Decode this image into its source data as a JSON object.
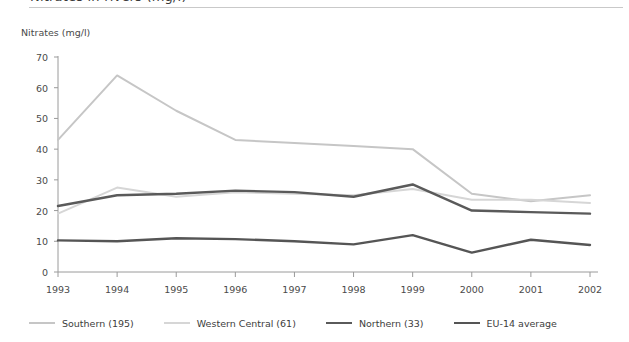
{
  "title": "Nitrates in rivers (mg/l)",
  "axis_title": "Nitrates (mg/l)",
  "legend": [
    {
      "label": "Southern (195)",
      "color": "#c6c6c6",
      "width": 2.0
    },
    {
      "label": "Western Central (61)",
      "color": "#d6d6d6",
      "width": 2.0
    },
    {
      "label": "Northern (33)",
      "color": "#5a5a5a",
      "width": 2.4
    },
    {
      "label": "EU-14 average",
      "color": "#555555",
      "width": 2.4
    }
  ],
  "chart_data": {
    "type": "line",
    "title": "Nitrates in rivers (mg/l)",
    "xlabel": "",
    "ylabel": "Nitrates (mg/l)",
    "categories": [
      "1993",
      "1994",
      "1995",
      "1996",
      "1997",
      "1998",
      "1999",
      "2000",
      "2001",
      "2002"
    ],
    "ylim": [
      0,
      70
    ],
    "yticks": [
      0,
      10,
      20,
      30,
      40,
      50,
      60,
      70
    ],
    "grid": false,
    "legend_position": "bottom",
    "series": [
      {
        "name": "Southern (195)",
        "color": "#c6c6c6",
        "width": 2.0,
        "values": [
          43.0,
          64.0,
          52.5,
          43.0,
          42.0,
          41.0,
          40.0,
          25.5,
          23.0,
          25.0
        ]
      },
      {
        "name": "Western Central (61)",
        "color": "#d6d6d6",
        "width": 2.0,
        "values": [
          19.0,
          27.5,
          24.5,
          26.0,
          25.5,
          25.0,
          27.0,
          23.5,
          23.5,
          22.5
        ]
      },
      {
        "name": "Northern (33)",
        "color": "#5a5a5a",
        "width": 2.4,
        "values": [
          21.5,
          25.0,
          25.5,
          26.5,
          26.0,
          24.5,
          28.5,
          20.0,
          19.5,
          19.0
        ]
      },
      {
        "name": "EU-14 average",
        "color": "#555555",
        "width": 2.4,
        "values": [
          10.3,
          10.0,
          11.0,
          10.7,
          10.0,
          9.0,
          12.0,
          6.3,
          10.5,
          8.8
        ]
      }
    ]
  }
}
